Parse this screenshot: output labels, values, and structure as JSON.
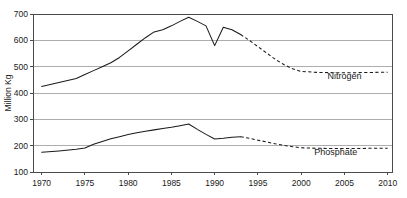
{
  "chart_data": {
    "type": "line",
    "title": "",
    "xlabel": "",
    "ylabel": "Million Kg",
    "xlim": [
      1969,
      2010.5
    ],
    "ylim": [
      100,
      700
    ],
    "grid": true,
    "grid_axis": "y",
    "legend_position": "inline-right",
    "x_ticks": [
      "1970",
      "1975",
      "1980",
      "1985",
      "1990",
      "1995",
      "2000",
      "2005",
      "2010"
    ],
    "x_tick_values": [
      1970,
      1975,
      1980,
      1985,
      1990,
      1995,
      2000,
      2005,
      2010
    ],
    "y_ticks": [
      "100",
      "200",
      "300",
      "400",
      "500",
      "600",
      "700"
    ],
    "y_tick_values": [
      100,
      200,
      300,
      400,
      500,
      600,
      700
    ],
    "series": [
      {
        "name": "Nitrogen",
        "label": "Nitrogen",
        "style_solid_until": 1993,
        "x": [
          1970,
          1972,
          1974,
          1975,
          1976,
          1977,
          1978,
          1979,
          1980,
          1981,
          1982,
          1983,
          1984,
          1985,
          1986,
          1987,
          1988,
          1989,
          1990,
          1991,
          1992,
          1993,
          1994,
          1995,
          1996,
          1997,
          1998,
          1999,
          2000,
          2002,
          2004,
          2006,
          2008,
          2010
        ],
        "values": [
          425,
          440,
          455,
          470,
          485,
          500,
          515,
          535,
          560,
          585,
          610,
          632,
          640,
          655,
          672,
          688,
          672,
          655,
          580,
          650,
          640,
          622,
          600,
          576,
          552,
          528,
          508,
          492,
          482,
          478,
          477,
          477,
          478,
          479
        ]
      },
      {
        "name": "Phosphate",
        "label": "Phosphate",
        "style_solid_until": 1993,
        "x": [
          1970,
          1972,
          1974,
          1975,
          1976,
          1977,
          1978,
          1979,
          1980,
          1981,
          1982,
          1983,
          1984,
          1985,
          1986,
          1987,
          1988,
          1989,
          1990,
          1991,
          1992,
          1993,
          1994,
          1995,
          1996,
          1997,
          1998,
          1999,
          2000,
          2002,
          2004,
          2006,
          2008,
          2010
        ],
        "values": [
          175,
          180,
          186,
          191,
          205,
          216,
          226,
          234,
          242,
          249,
          255,
          260,
          265,
          270,
          276,
          282,
          262,
          243,
          225,
          228,
          232,
          234,
          228,
          221,
          214,
          207,
          201,
          196,
          192,
          190,
          189,
          189,
          190,
          190
        ]
      }
    ],
    "annotations": [
      {
        "text": "Nitrogen",
        "x": 2005,
        "y": 455
      },
      {
        "text": "Phosphate",
        "x": 2004,
        "y": 163
      }
    ],
    "colors": {
      "series_line": "#1a1a1a",
      "gridline": "#8a8a8a",
      "frame": "#4a4a4a",
      "background": "#ffffff",
      "text": "#1a1a1a"
    }
  }
}
